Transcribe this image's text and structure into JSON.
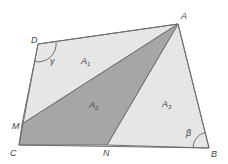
{
  "diagram": {
    "type": "quadrilateral-partition",
    "vertices": {
      "A": {
        "label": "A",
        "x": 178,
        "y": 24,
        "lx": 181,
        "ly": 19
      },
      "B": {
        "label": "B",
        "x": 209,
        "y": 148,
        "lx": 211,
        "ly": 157
      },
      "C": {
        "label": "C",
        "x": 19,
        "y": 145,
        "lx": 10,
        "ly": 156
      },
      "D": {
        "label": "D",
        "x": 38,
        "y": 44,
        "lx": 31,
        "ly": 43
      },
      "M": {
        "label": "M",
        "x": 22,
        "y": 124,
        "lx": 12,
        "ly": 129
      },
      "N": {
        "label": "N",
        "x": 107,
        "y": 145,
        "lx": 103,
        "ly": 156
      }
    },
    "regions": [
      {
        "id": "A1",
        "label": "A",
        "sub": "1",
        "vertices": [
          "D",
          "A",
          "M"
        ],
        "fill": "#e6e6e6",
        "lx": 81,
        "ly": 64
      },
      {
        "id": "A2",
        "label": "A",
        "sub": "2",
        "vertices": [
          "A",
          "M",
          "C",
          "N"
        ],
        "fill": "#a6a6a6",
        "lx": 89,
        "ly": 108
      },
      {
        "id": "A3",
        "label": "A",
        "sub": "3",
        "vertices": [
          "A",
          "N",
          "B"
        ],
        "fill": "#e6e6e6",
        "lx": 162,
        "ly": 107
      }
    ],
    "angles": [
      {
        "id": "gamma",
        "label": "γ",
        "vertex": "D",
        "lx": 50,
        "ly": 64
      },
      {
        "id": "beta",
        "label": "β",
        "vertex": "B",
        "lx": 186,
        "ly": 136
      }
    ],
    "stroke_color": "#6e6e6e",
    "label_color": "#444444"
  }
}
